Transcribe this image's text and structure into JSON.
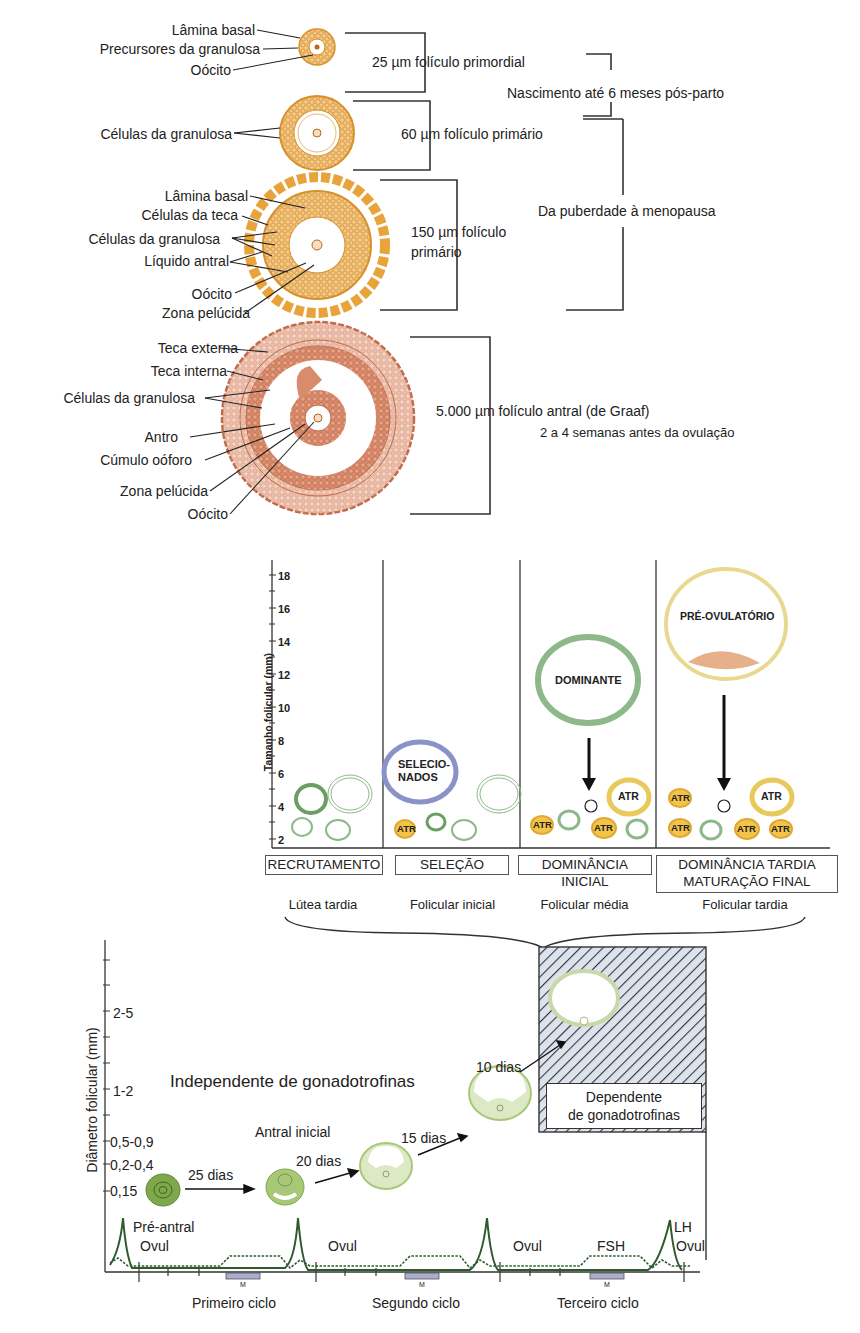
{
  "panel_a": {
    "stages": [
      {
        "size_label": "25 µm folículo primordial",
        "labels": [
          "Lâmina basal",
          "Precursores da granulosa",
          "Oócito"
        ]
      },
      {
        "size_label": "60 µm folículo primário",
        "labels": [
          "Células da granulosa"
        ]
      },
      {
        "size_label_line1": "150 µm folículo",
        "size_label_line2": "primário",
        "labels": [
          "Lâmina basal",
          "Células da teca",
          "Células da granulosa",
          "Líquido antral",
          "Oócito",
          "Zona pelúcida"
        ]
      },
      {
        "size_label": "5.000 µm folículo antral (de Graaf)",
        "timing": "2 a 4 semanas antes da ovulação",
        "labels": [
          "Teca externa",
          "Teca interna",
          "Células da granulosa",
          "Antro",
          "Cúmulo oóforo",
          "Zona pelúcida",
          "Oócito"
        ]
      }
    ],
    "period_birth": "Nascimento até 6 meses pós-parto",
    "period_puberty": "Da puberdade à menopausa",
    "colors": {
      "early": "#e8a33a",
      "antral": "#c8785a"
    }
  },
  "panel_b": {
    "y_axis_label": "Tamanho folicular (mm)",
    "y_ticks": [
      "18",
      "16",
      "14",
      "12",
      "10",
      "8",
      "6",
      "4",
      "2"
    ],
    "follicle_labels": {
      "selected": "SELECIO-\nNADOS",
      "selected_l1": "SELECIO-",
      "selected_l2": "NADOS",
      "dominant": "DOMINANTE",
      "preovulatory": "PRÉ-OVULATÓRIO",
      "atretic": "ATR",
      "inhibition": "⊖"
    },
    "stages": [
      {
        "name": "RECRUTAMENTO",
        "phase": "Lútea tardia"
      },
      {
        "name": "SELEÇÃO",
        "phase": "Folicular inicial"
      },
      {
        "name": "DOMINÂNCIA INICIAL",
        "phase": "Folicular média"
      },
      {
        "name_l1": "DOMINÂNCIA TARDIA",
        "name_l2": "MATURAÇÃO FINAL",
        "phase": "Folicular tardia"
      }
    ],
    "colors": {
      "green": "#7aa874",
      "blue": "#8a93c8",
      "yellow": "#e8c95a",
      "atr": "#e0a830"
    }
  },
  "panel_c": {
    "y_axis_label": "Diâmetro folicular (mm)",
    "y_ticks": [
      "2-5",
      "1-2",
      "0,5-0,9",
      "0,2-0,4",
      "0,15"
    ],
    "independent_label": "Independente de gonadotrofinas",
    "dependent_label_l1": "Dependente",
    "dependent_label_l2": "de gonadotrofinas",
    "stage_labels": {
      "preantral": "Pré-antral",
      "early_antral": "Antral inicial"
    },
    "durations": [
      "25 dias",
      "20 dias",
      "15 dias",
      "10 dias"
    ],
    "hormone_labels": {
      "ovul": "Ovul",
      "fsh": "FSH",
      "lh": "LH",
      "menses": "M"
    },
    "cycles": [
      "Primeiro ciclo",
      "Segundo ciclo",
      "Terceiro ciclo"
    ]
  }
}
